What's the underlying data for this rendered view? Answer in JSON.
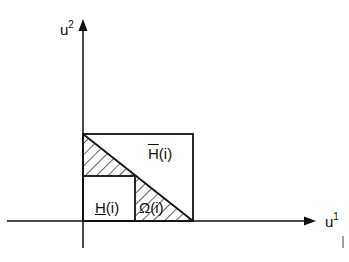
{
  "figure": {
    "axes": {
      "vertical": {
        "base": "u",
        "superscript": "2"
      },
      "horizontal": {
        "base": "u",
        "superscript": "1"
      }
    },
    "regions": {
      "upper_set": {
        "base": "H",
        "mark": "overline",
        "arg": "(i)"
      },
      "lower_set": {
        "base": "H",
        "mark": "underline",
        "arg": "(i)"
      },
      "omega": {
        "base": "Ω",
        "arg": "(i)"
      }
    },
    "stroke_color": "#111111",
    "background": "#ffffff"
  }
}
